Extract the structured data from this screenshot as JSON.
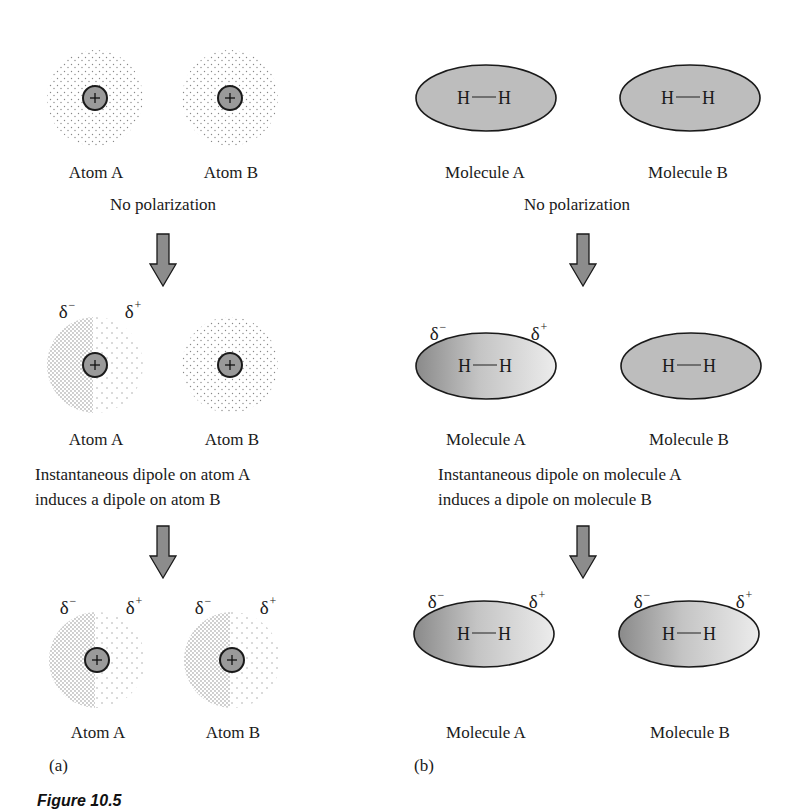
{
  "figure": {
    "caption": "Figure 10.5",
    "panels": [
      {
        "tag": "(a)",
        "stages": [
          {
            "entities": [
              {
                "label": "Atom A",
                "polarized": false
              },
              {
                "label": "Atom B",
                "polarized": false
              }
            ],
            "description": [
              "No polarization"
            ]
          },
          {
            "entities": [
              {
                "label": "Atom A",
                "polarized": true,
                "delta_minus": "δ",
                "delta_plus": "δ",
                "minus_sign": "−",
                "plus_sign": "+"
              },
              {
                "label": "Atom B",
                "polarized": false
              }
            ],
            "description": [
              "Instantaneous dipole on atom A",
              "induces a dipole on atom B"
            ]
          },
          {
            "entities": [
              {
                "label": "Atom A",
                "polarized": true,
                "delta_minus": "δ",
                "delta_plus": "δ",
                "minus_sign": "−",
                "plus_sign": "+"
              },
              {
                "label": "Atom B",
                "polarized": true,
                "delta_minus": "δ",
                "delta_plus": "δ",
                "minus_sign": "−",
                "plus_sign": "+"
              }
            ],
            "description": []
          }
        ],
        "nucleus_symbol": "+"
      },
      {
        "tag": "(b)",
        "stages": [
          {
            "entities": [
              {
                "label": "Molecule A",
                "formula_left": "H",
                "formula_right": "H",
                "polarized": false
              },
              {
                "label": "Molecule B",
                "formula_left": "H",
                "formula_right": "H",
                "polarized": false
              }
            ],
            "description": [
              "No polarization"
            ]
          },
          {
            "entities": [
              {
                "label": "Molecule A",
                "formula_left": "H",
                "formula_right": "H",
                "polarized": true,
                "delta_minus": "δ",
                "delta_plus": "δ",
                "minus_sign": "−",
                "plus_sign": "+"
              },
              {
                "label": "Molecule B",
                "formula_left": "H",
                "formula_right": "H",
                "polarized": false
              }
            ],
            "description": [
              "Instantaneous dipole on molecule A",
              "induces a dipole on molecule B"
            ]
          },
          {
            "entities": [
              {
                "label": "Molecule A",
                "formula_left": "H",
                "formula_right": "H",
                "polarized": true,
                "delta_minus": "δ",
                "delta_plus": "δ",
                "minus_sign": "−",
                "plus_sign": "+"
              },
              {
                "label": "Molecule B",
                "formula_left": "H",
                "formula_right": "H",
                "polarized": true,
                "delta_minus": "δ",
                "delta_plus": "δ",
                "minus_sign": "−",
                "plus_sign": "+"
              }
            ],
            "description": []
          }
        ]
      }
    ],
    "colors": {
      "nucleus_fill": "#9a9a9a",
      "ellipse_fill": "#bdbdbd",
      "gradient_dark": "#8a8a8a",
      "gradient_light": "#e6e6e6",
      "arrow_fill": "#8c8c8c",
      "stroke": "#1a1a1a",
      "dots": "#8a8a8a"
    }
  }
}
